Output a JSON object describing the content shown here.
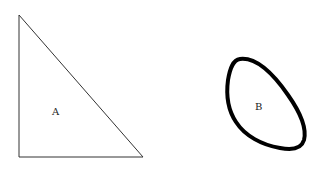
{
  "shapes": {
    "triangle": {
      "label": "A"
    },
    "blob": {
      "label": "B"
    }
  },
  "colors": {
    "stroke": "#222222",
    "background": "#ffffff"
  }
}
